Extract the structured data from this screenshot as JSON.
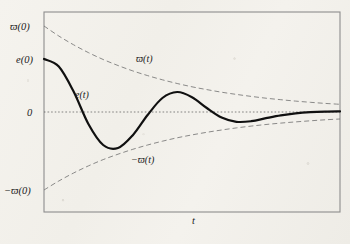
{
  "figure": {
    "background_color": "#f3f1ec",
    "frame_color": "#8d8d8d",
    "curve_color": "#101010",
    "envelope_color": "#6e6e6e",
    "zero_line_color": "#555555"
  },
  "axes": {
    "x_axis_label": "t",
    "y_tick_labels": {
      "top": "ϖ(0)",
      "upper_mid": "e(0)",
      "zero": "0",
      "bottom": "−ϖ(0)"
    },
    "x_range": [
      0,
      1
    ],
    "y_range": [
      -1,
      1
    ],
    "grid": false,
    "zero_line": true
  },
  "curve_labels": {
    "upper_envelope": "ϖ(t)",
    "error": "e(t)",
    "lower_envelope": "−ϖ(t)"
  },
  "chart_data": {
    "type": "line",
    "title": "",
    "xlabel": "t",
    "ylabel": "",
    "xlim": [
      0,
      1
    ],
    "ylim": [
      -1,
      1
    ],
    "grid": false,
    "legend": "inline-annotations",
    "annotations": [
      {
        "text": "ϖ(0)",
        "x": 0.0,
        "y": 0.86,
        "placement": "left-of-axis"
      },
      {
        "text": "e(0)",
        "x": 0.0,
        "y": 0.53,
        "placement": "left-of-axis"
      },
      {
        "text": "0",
        "x": 0.0,
        "y": 0.0,
        "placement": "left-of-axis"
      },
      {
        "text": "−ϖ(0)",
        "x": 0.0,
        "y": -0.78,
        "placement": "left-of-axis"
      },
      {
        "text": "ϖ(t)",
        "x": 0.33,
        "y": 0.56,
        "placement": "inside"
      },
      {
        "text": "e(t)",
        "x": 0.12,
        "y": 0.22,
        "placement": "inside"
      },
      {
        "text": "−ϖ(t)",
        "x": 0.31,
        "y": -0.42,
        "placement": "inside"
      },
      {
        "text": "t",
        "x": 0.52,
        "y": -1.08,
        "placement": "below-axis"
      }
    ],
    "series": [
      {
        "name": "ϖ(t)",
        "style": "dashed",
        "width": 0.8,
        "color": "#6e6e6e",
        "x": [
          0.0,
          0.05,
          0.1,
          0.15,
          0.2,
          0.25,
          0.3,
          0.35,
          0.4,
          0.45,
          0.5,
          0.55,
          0.6,
          0.65,
          0.7,
          0.75,
          0.8,
          0.85,
          0.9,
          0.95,
          1.0
        ],
        "y": [
          0.86,
          0.76,
          0.672,
          0.594,
          0.525,
          0.465,
          0.411,
          0.364,
          0.322,
          0.285,
          0.252,
          0.224,
          0.198,
          0.176,
          0.156,
          0.138,
          0.123,
          0.109,
          0.097,
          0.086,
          0.077
        ]
      },
      {
        "name": "e(t)",
        "style": "solid",
        "width": 2.2,
        "color": "#101010",
        "x": [
          0.0,
          0.05,
          0.1,
          0.15,
          0.2,
          0.25,
          0.3,
          0.35,
          0.4,
          0.45,
          0.5,
          0.55,
          0.6,
          0.65,
          0.7,
          0.75,
          0.8,
          0.85,
          0.9,
          0.95,
          1.0
        ],
        "y": [
          0.53,
          0.455,
          0.205,
          -0.12,
          -0.33,
          -0.36,
          -0.232,
          -0.03,
          0.14,
          0.2,
          0.148,
          0.04,
          -0.055,
          -0.098,
          -0.092,
          -0.062,
          -0.034,
          -0.014,
          -0.002,
          0.004,
          0.006
        ]
      },
      {
        "name": "−ϖ(t)",
        "style": "dashed",
        "width": 0.8,
        "color": "#6e6e6e",
        "x": [
          0.0,
          0.05,
          0.1,
          0.15,
          0.2,
          0.25,
          0.3,
          0.35,
          0.4,
          0.45,
          0.5,
          0.55,
          0.6,
          0.65,
          0.7,
          0.75,
          0.8,
          0.85,
          0.9,
          0.95,
          1.0
        ],
        "y": [
          -0.78,
          -0.69,
          -0.61,
          -0.539,
          -0.476,
          -0.422,
          -0.373,
          -0.33,
          -0.292,
          -0.258,
          -0.229,
          -0.203,
          -0.18,
          -0.159,
          -0.141,
          -0.125,
          -0.111,
          -0.099,
          -0.088,
          -0.078,
          -0.07
        ]
      },
      {
        "name": "zero",
        "style": "dotted",
        "width": 0.7,
        "color": "#555555",
        "x": [
          0.0,
          1.0
        ],
        "y": [
          0.0,
          0.0
        ]
      }
    ]
  }
}
